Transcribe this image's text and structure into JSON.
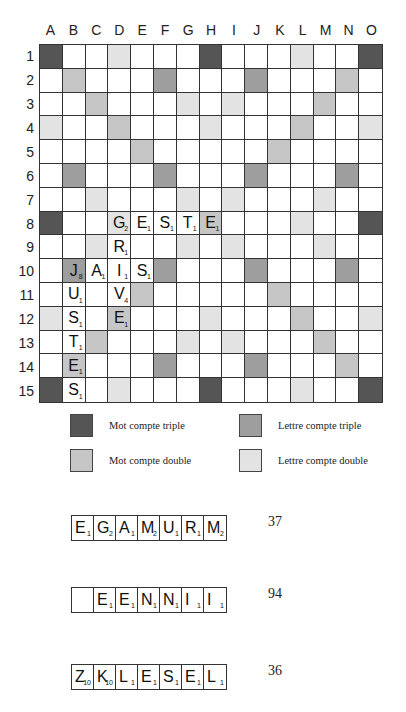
{
  "board": {
    "columns": [
      "A",
      "B",
      "C",
      "D",
      "E",
      "F",
      "G",
      "H",
      "I",
      "J",
      "K",
      "L",
      "M",
      "N",
      "O"
    ],
    "rows": [
      "1",
      "2",
      "3",
      "4",
      "5",
      "6",
      "7",
      "8",
      "9",
      "10",
      "11",
      "12",
      "13",
      "14",
      "15"
    ],
    "premium_layout": [
      "T..d...T...d..T",
      ".D...t...t...D.",
      "..D...d.d...D..",
      "d..D...d...D..d",
      "....D.....D....",
      ".t...t...t...t.",
      "..d...d.d...d..",
      "T..d...D...d..T",
      "..d...d.d...d..",
      ".t...t...t...t.",
      "....D.....D....",
      "d..D...d...D..d",
      "..D...d.d...D..",
      ".D...t...t...D.",
      "T..d...T...d..T"
    ],
    "premium_legend_key": {
      "T": "tw",
      "D": "dw",
      "t": "tl",
      "d": "dl"
    },
    "placed_tiles": [
      {
        "col": 3,
        "row": 7,
        "letter": "G",
        "points": "2"
      },
      {
        "col": 4,
        "row": 7,
        "letter": "E",
        "points": "1"
      },
      {
        "col": 5,
        "row": 7,
        "letter": "S",
        "points": "1"
      },
      {
        "col": 6,
        "row": 7,
        "letter": "T",
        "points": "1"
      },
      {
        "col": 7,
        "row": 7,
        "letter": "E",
        "points": "1"
      },
      {
        "col": 3,
        "row": 8,
        "letter": "R",
        "points": "1"
      },
      {
        "col": 1,
        "row": 9,
        "letter": "J",
        "points": "8"
      },
      {
        "col": 2,
        "row": 9,
        "letter": "A",
        "points": "1"
      },
      {
        "col": 3,
        "row": 9,
        "letter": "I",
        "points": "1"
      },
      {
        "col": 4,
        "row": 9,
        "letter": "S",
        "points": "1"
      },
      {
        "col": 1,
        "row": 10,
        "letter": "U",
        "points": "1"
      },
      {
        "col": 3,
        "row": 10,
        "letter": "V",
        "points": "4"
      },
      {
        "col": 1,
        "row": 11,
        "letter": "S",
        "points": "1"
      },
      {
        "col": 3,
        "row": 11,
        "letter": "E",
        "points": "1"
      },
      {
        "col": 1,
        "row": 12,
        "letter": "T",
        "points": "1"
      },
      {
        "col": 1,
        "row": 13,
        "letter": "E",
        "points": "1"
      },
      {
        "col": 1,
        "row": 14,
        "letter": "S",
        "points": "1"
      }
    ]
  },
  "legend": [
    {
      "label": "Mot compte triple",
      "color": "#555555"
    },
    {
      "label": "Lettre compte triple",
      "color": "#9e9e9e"
    },
    {
      "label": "Mot compte double",
      "color": "#c6c6c6"
    },
    {
      "label": "Lettre compte double",
      "color": "#e3e3e3"
    }
  ],
  "racks": [
    {
      "tiles": [
        {
          "letter": "E",
          "points": "1"
        },
        {
          "letter": "G",
          "points": "2"
        },
        {
          "letter": "A",
          "points": "1"
        },
        {
          "letter": "M",
          "points": "2"
        },
        {
          "letter": "U",
          "points": "1"
        },
        {
          "letter": "R",
          "points": "1"
        },
        {
          "letter": "M",
          "points": "2"
        }
      ],
      "score": "37"
    },
    {
      "tiles": [
        {
          "letter": "",
          "points": ""
        },
        {
          "letter": "E",
          "points": "1"
        },
        {
          "letter": "E",
          "points": "1"
        },
        {
          "letter": "N",
          "points": "1"
        },
        {
          "letter": "N",
          "points": "1"
        },
        {
          "letter": "I",
          "points": "1"
        },
        {
          "letter": "I",
          "points": "1"
        }
      ],
      "score": "94"
    },
    {
      "tiles": [
        {
          "letter": "Z",
          "points": "10"
        },
        {
          "letter": "K",
          "points": "10"
        },
        {
          "letter": "L",
          "points": "1"
        },
        {
          "letter": "E",
          "points": "1"
        },
        {
          "letter": "S",
          "points": "1"
        },
        {
          "letter": "E",
          "points": "1"
        },
        {
          "letter": "L",
          "points": "1"
        }
      ],
      "score": "36"
    }
  ]
}
